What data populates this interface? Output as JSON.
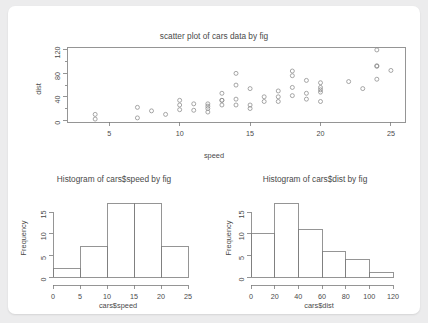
{
  "figure": {
    "background_color": "#ececed",
    "card_color": "#ffffff",
    "axis_color": "#7a7a7a",
    "text_color": "#4a4a4a",
    "point_color": "#8a8a8a"
  },
  "chart_data": [
    {
      "type": "scatter",
      "name": "scatter-cars",
      "title": "scatter plot of cars data by fig",
      "xlabel": "speed",
      "ylabel": "dist",
      "xlim": [
        2,
        26
      ],
      "ylim": [
        -3,
        125
      ],
      "xticks": [
        5,
        10,
        15,
        20,
        25
      ],
      "yticks": [
        0,
        40,
        80,
        120
      ],
      "grid": false,
      "marker": "open-circle",
      "x": [
        4,
        4,
        7,
        7,
        8,
        9,
        10,
        10,
        10,
        11,
        11,
        12,
        12,
        12,
        12,
        13,
        13,
        13,
        13,
        14,
        14,
        14,
        14,
        15,
        15,
        15,
        16,
        16,
        17,
        17,
        17,
        18,
        18,
        18,
        18,
        19,
        19,
        19,
        20,
        20,
        20,
        20,
        20,
        22,
        23,
        24,
        24,
        24,
        24,
        25
      ],
      "y": [
        2,
        10,
        4,
        22,
        16,
        10,
        18,
        26,
        34,
        17,
        28,
        14,
        20,
        24,
        28,
        26,
        34,
        34,
        46,
        26,
        36,
        60,
        80,
        20,
        26,
        54,
        32,
        40,
        32,
        40,
        50,
        42,
        56,
        76,
        84,
        36,
        46,
        68,
        32,
        48,
        52,
        56,
        64,
        66,
        54,
        70,
        92,
        93,
        120,
        85
      ]
    },
    {
      "type": "bar",
      "name": "hist-cars-speed",
      "title": "Histogram of cars$speed by fig",
      "xlabel": "cars$speed",
      "ylabel": "Frequency",
      "xlim": [
        0,
        25
      ],
      "ylim": [
        0,
        18
      ],
      "xticks": [
        0,
        5,
        10,
        15,
        20,
        25
      ],
      "yticks": [
        0,
        5,
        10,
        15
      ],
      "grid": false,
      "bin_edges": [
        0,
        5,
        10,
        15,
        20,
        25
      ],
      "categories": [
        "0-5",
        "5-10",
        "10-15",
        "15-20",
        "20-25"
      ],
      "values": [
        2,
        7,
        17,
        17,
        7
      ]
    },
    {
      "type": "bar",
      "name": "hist-cars-dist",
      "title": "Histogram of cars$dist by fig",
      "xlabel": "cars$dist",
      "ylabel": "Frequency",
      "xlim": [
        0,
        120
      ],
      "ylim": [
        0,
        18
      ],
      "xticks": [
        0,
        20,
        40,
        60,
        80,
        100,
        120
      ],
      "yticks": [
        0,
        5,
        10,
        15
      ],
      "grid": false,
      "bin_edges": [
        0,
        20,
        40,
        60,
        80,
        100,
        120
      ],
      "categories": [
        "0-20",
        "20-40",
        "40-60",
        "60-80",
        "80-100",
        "100-120"
      ],
      "values": [
        10,
        17,
        11,
        6,
        4,
        1
      ]
    }
  ]
}
